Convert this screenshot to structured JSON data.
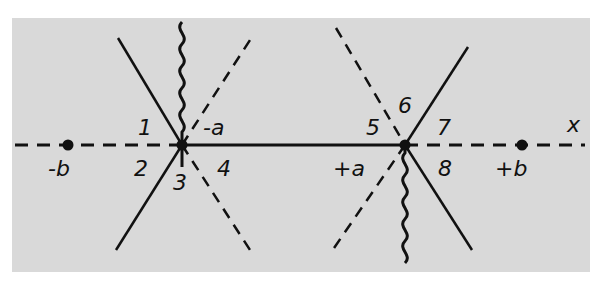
{
  "diagram": {
    "type": "complex-plane branch cut diagram",
    "axis_label": "x",
    "points": [
      {
        "id": "minus-b",
        "label": "-b",
        "x": 68,
        "y": 145
      },
      {
        "id": "minus-a",
        "label": "-a",
        "x": 182,
        "y": 145
      },
      {
        "id": "plus-a",
        "label": "+a",
        "x": 405,
        "y": 145
      },
      {
        "id": "plus-b",
        "label": "+b",
        "x": 522,
        "y": 145
      }
    ],
    "region_labels": [
      "1",
      "2",
      "3",
      "4",
      "5",
      "6",
      "7",
      "8"
    ],
    "colors": {
      "panel": "#d9d9d9",
      "ink": "#111111",
      "background": "#ffffff"
    }
  }
}
